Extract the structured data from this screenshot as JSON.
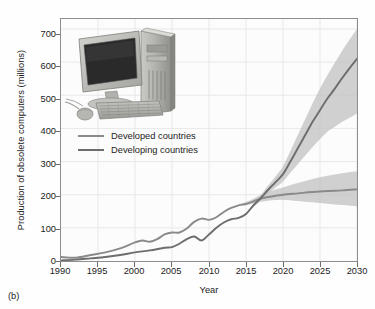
{
  "figure": {
    "panel_label": "(b)",
    "inset_icon": "desktop-computer-photo"
  },
  "chart_data": {
    "type": "line",
    "title": "",
    "xlabel": "Year",
    "ylabel": "Production of obsolete computers (millions)",
    "xlim": [
      1990,
      2030
    ],
    "ylim": [
      0,
      730
    ],
    "xticks": [
      1990,
      1995,
      2000,
      2005,
      2010,
      2015,
      2020,
      2025,
      2030
    ],
    "yticks": [
      0,
      100,
      200,
      300,
      400,
      500,
      600,
      700
    ],
    "grid": true,
    "legend_position": "upper-left-inside",
    "series": [
      {
        "name": "Developed countries",
        "color": "#8a8a8a",
        "x": [
          1990,
          1992,
          1994,
          1996,
          1998,
          2000,
          2001,
          2002,
          2003,
          2004,
          2005,
          2006,
          2007,
          2008,
          2009,
          2010,
          2011,
          2012,
          2013,
          2014,
          2015,
          2016,
          2017,
          2018,
          2019,
          2020,
          2022,
          2024,
          2026,
          2028,
          2030
        ],
        "values": [
          12,
          10,
          18,
          26,
          38,
          56,
          62,
          58,
          66,
          80,
          86,
          86,
          98,
          118,
          128,
          124,
          132,
          148,
          160,
          168,
          172,
          180,
          188,
          193,
          197,
          200,
          204,
          208,
          211,
          213,
          216
        ],
        "band_lower": [
          12,
          10,
          18,
          26,
          38,
          56,
          62,
          58,
          66,
          80,
          86,
          86,
          98,
          118,
          128,
          124,
          132,
          148,
          160,
          166,
          168,
          174,
          179,
          182,
          184,
          185,
          181,
          177,
          173,
          169,
          165
        ],
        "band_upper": [
          12,
          10,
          18,
          26,
          38,
          56,
          62,
          58,
          66,
          80,
          86,
          86,
          98,
          118,
          128,
          124,
          132,
          148,
          160,
          170,
          178,
          188,
          199,
          208,
          216,
          222,
          235,
          247,
          257,
          265,
          271
        ]
      },
      {
        "name": "Developing countries",
        "color": "#6d6d6d",
        "x": [
          1990,
          1992,
          1994,
          1996,
          1998,
          2000,
          2002,
          2004,
          2005,
          2006,
          2007,
          2008,
          2009,
          2010,
          2011,
          2012,
          2013,
          2014,
          2015,
          2016,
          2017,
          2018,
          2019,
          2020,
          2021,
          2022,
          2023,
          2024,
          2025,
          2026,
          2027,
          2028,
          2029,
          2030
        ],
        "values": [
          2,
          4,
          8,
          12,
          18,
          26,
          32,
          40,
          42,
          52,
          66,
          74,
          62,
          80,
          100,
          116,
          126,
          130,
          142,
          168,
          190,
          215,
          238,
          262,
          300,
          340,
          380,
          420,
          455,
          490,
          520,
          552,
          582,
          610
        ],
        "band_lower": [
          2,
          4,
          8,
          12,
          18,
          26,
          32,
          40,
          42,
          52,
          66,
          74,
          62,
          80,
          100,
          116,
          126,
          130,
          140,
          162,
          182,
          203,
          222,
          240,
          266,
          292,
          318,
          344,
          368,
          390,
          405,
          420,
          432,
          445
        ],
        "band_upper": [
          2,
          4,
          8,
          12,
          18,
          26,
          32,
          40,
          42,
          52,
          66,
          74,
          62,
          80,
          100,
          116,
          126,
          130,
          144,
          173,
          199,
          228,
          256,
          286,
          332,
          380,
          428,
          476,
          520,
          560,
          598,
          634,
          668,
          700
        ]
      }
    ],
    "annotations": {
      "crossover_year": 2017,
      "crossover_value": 190
    }
  }
}
